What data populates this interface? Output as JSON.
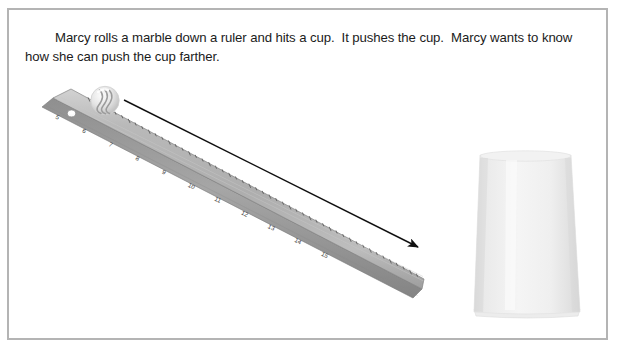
{
  "panel": {
    "border_color": "#b4b4b4",
    "background": "#ffffff"
  },
  "prompt": {
    "text": "Marcy rolls a marble down a ruler and hits a cup.  It pushes the cup.  Marcy wants to know how she can push the cup farther.",
    "color": "#1b1b1b"
  },
  "illustration": {
    "ruler": {
      "label": "plastic ruler tilted diagonally, marked in inches",
      "tick_numbers": [
        "5",
        "6",
        "7",
        "8",
        "9",
        "10",
        "11",
        "12",
        "13",
        "14",
        "15"
      ],
      "face_color": "#b6b6b6",
      "edge_color": "#8d8d8d",
      "mark_color": "#4a4a4a",
      "hanging_hole": "hanging-hole"
    },
    "marble": {
      "label": "glass marble with swirl resting at top of ruler",
      "color": "#e8e8e8",
      "swirl_color": "#9a9a9a"
    },
    "arrow": {
      "label": "arrow showing direction the marble rolls, pointing down toward the cup",
      "color": "#111111"
    },
    "cup": {
      "label": "white paper cup turned upside down",
      "color": "#f0f0f0",
      "shade_color": "#e2e2e2"
    }
  }
}
